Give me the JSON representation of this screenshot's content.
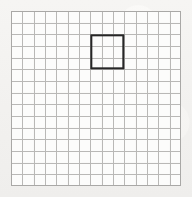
{
  "figure": {
    "type": "grid-diagram"
  },
  "chart_data": {
    "type": "table",
    "title": "",
    "xlabel": "",
    "ylabel": "",
    "grid": {
      "columns": 15,
      "rows": 15,
      "cell_width_px": 11.33,
      "cell_height_px": 11.67,
      "origin_x_px": 11,
      "origin_y_px": 11,
      "total_width_px": 170,
      "total_height_px": 175,
      "line_color": "#b9b8b6",
      "line_width_px": 1,
      "outer_border_color": "#a9a8a6"
    },
    "highlight": {
      "label": "bold-square",
      "start_column": 8,
      "start_row": 3,
      "span_columns": 3,
      "span_rows": 3,
      "left_px": 93,
      "top_px": 34,
      "width_px": 34,
      "height_px": 35,
      "stroke_color": "#262626",
      "stroke_width_px": 2
    },
    "background_color": "#f4f3f1",
    "cell_fill_color": "#fcfcfb"
  }
}
